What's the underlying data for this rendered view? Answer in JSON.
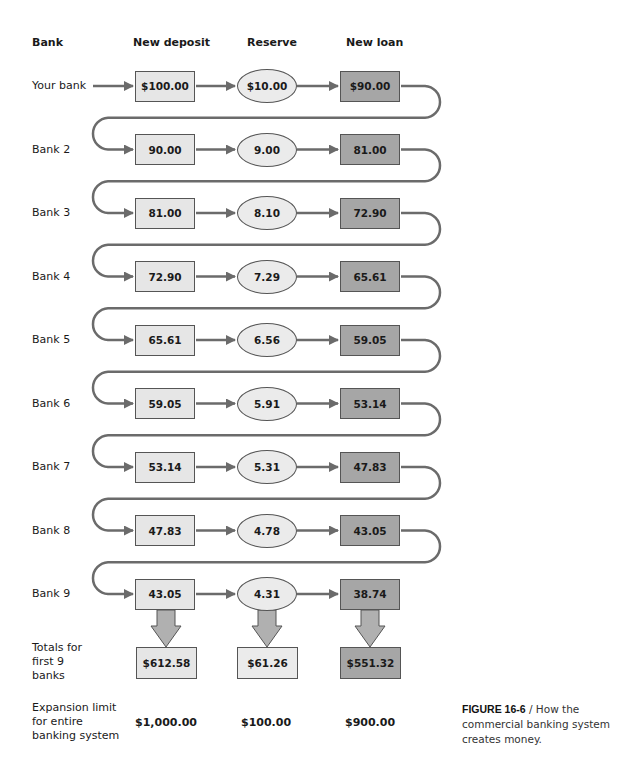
{
  "headers": {
    "bank": "Bank",
    "deposit": "New deposit",
    "reserve": "Reserve",
    "loan": "New loan"
  },
  "rows": [
    {
      "bank": "Your bank",
      "deposit": "$100.00",
      "reserve": "$10.00",
      "loan": "$90.00"
    },
    {
      "bank": "Bank 2",
      "deposit": "90.00",
      "reserve": "9.00",
      "loan": "81.00"
    },
    {
      "bank": "Bank 3",
      "deposit": "81.00",
      "reserve": "8.10",
      "loan": "72.90"
    },
    {
      "bank": "Bank 4",
      "deposit": "72.90",
      "reserve": "7.29",
      "loan": "65.61"
    },
    {
      "bank": "Bank 5",
      "deposit": "65.61",
      "reserve": "6.56",
      "loan": "59.05"
    },
    {
      "bank": "Bank 6",
      "deposit": "59.05",
      "reserve": "5.91",
      "loan": "53.14"
    },
    {
      "bank": "Bank 7",
      "deposit": "53.14",
      "reserve": "5.31",
      "loan": "47.83"
    },
    {
      "bank": "Bank 8",
      "deposit": "47.83",
      "reserve": "4.78",
      "loan": "43.05"
    },
    {
      "bank": "Bank 9",
      "deposit": "43.05",
      "reserve": "4.31",
      "loan": "38.74"
    }
  ],
  "totals": {
    "label_lines": [
      "Totals for",
      "first 9",
      "banks"
    ],
    "deposit": "$612.58",
    "reserve": "$61.26",
    "loan": "$551.32"
  },
  "limit": {
    "label_lines": [
      "Expansion limit",
      "for entire",
      "banking system"
    ],
    "deposit": "$1,000.00",
    "reserve": "$100.00",
    "loan": "$900.00"
  },
  "caption": {
    "figure": "FIGURE 16-6",
    "separator": " / ",
    "text": "How the commercial banking system creates money."
  },
  "colors": {
    "deposit_fill": "#e6e6e6",
    "reserve_fill": "#ebebeb",
    "loan_fill": "#a6a6a6",
    "arrow": "#6b6b6b"
  }
}
